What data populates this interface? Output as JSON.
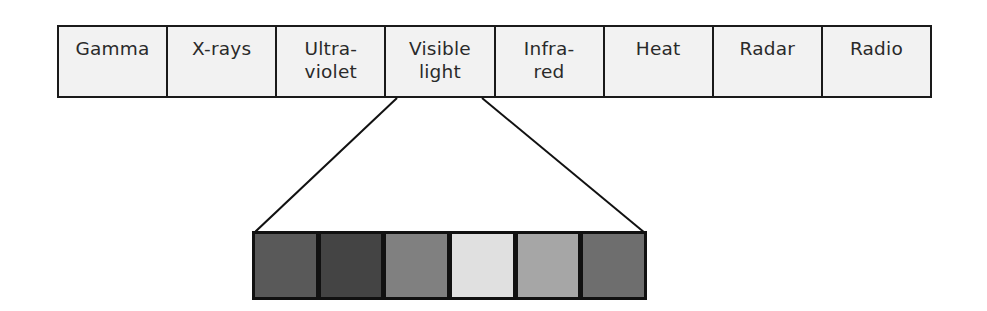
{
  "diagram": {
    "title": "",
    "spectrum_bands": [
      {
        "label": "Gamma"
      },
      {
        "label": "X-rays"
      },
      {
        "label": "Ultra-\nviolet"
      },
      {
        "label": "Visible\nlight"
      },
      {
        "label": "Infra-\nred"
      },
      {
        "label": "Heat"
      },
      {
        "label": "Radar"
      },
      {
        "label": "Radio"
      }
    ],
    "expanded_band_index": 3,
    "expanded_band_label": "Visible light",
    "visible_swatches": [
      {
        "color": "#595959"
      },
      {
        "color": "#444444"
      },
      {
        "color": "#808080"
      },
      {
        "color": "#e0e0e0"
      },
      {
        "color": "#a6a6a6"
      },
      {
        "color": "#6e6e6e"
      }
    ],
    "colors": {
      "band_fill": "#f2f2f2",
      "border": "#1a1a1a",
      "text": "#2a2a2a"
    }
  }
}
